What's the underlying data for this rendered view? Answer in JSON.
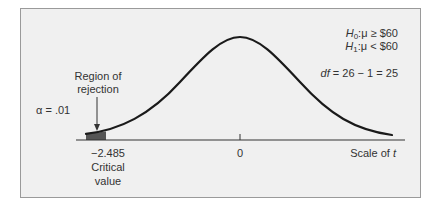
{
  "diagram": {
    "type": "t-distribution-one-tailed-test",
    "colors": {
      "panel_background": "#f0f0f0",
      "panel_border": "#9a9a9a",
      "curve": "#1a1a1a",
      "axis": "#333333",
      "rejection_fill": "#555555",
      "text": "#333333"
    },
    "hypotheses": {
      "null": {
        "symbol": "H",
        "subscript": "0",
        "statement": ":μ ≥ $60"
      },
      "alternative": {
        "symbol": "H",
        "subscript": "1",
        "statement": ":μ < $60"
      }
    },
    "degrees_of_freedom": {
      "symbol": "df",
      "expression": " = 26 − 1 = 25"
    },
    "alpha_label": "α  = .01",
    "rejection_region_label": {
      "line1": "Region of",
      "line2": "rejection"
    },
    "axis": {
      "center_tick_label": "0",
      "scale_label_prefix": "Scale of ",
      "scale_label_var": "t"
    },
    "critical_value": {
      "value": "−2.485",
      "line2": "Critical",
      "line3": "value"
    }
  }
}
